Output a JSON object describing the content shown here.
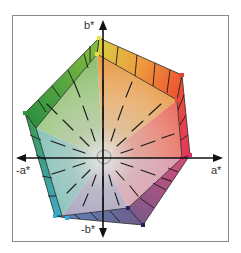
{
  "diagram": {
    "type": "CIELAB color gamut projection (a*-b* plane)",
    "axes": {
      "b_plus": "b*",
      "b_minus": "-b*",
      "a_plus": "a*",
      "a_minus": "-a*"
    },
    "vertices": [
      {
        "name": "yellow",
        "color": "#f5e62a"
      },
      {
        "name": "red",
        "color": "#e8402a"
      },
      {
        "name": "magenta",
        "color": "#e0306a"
      },
      {
        "name": "blue",
        "color": "#262060"
      },
      {
        "name": "cyan",
        "color": "#30b0e0"
      },
      {
        "name": "green",
        "color": "#2a9a3a"
      }
    ],
    "colors": {
      "frame": "#8a8a8a",
      "axis": "#111111",
      "hatch": "#1a1a1a"
    }
  }
}
